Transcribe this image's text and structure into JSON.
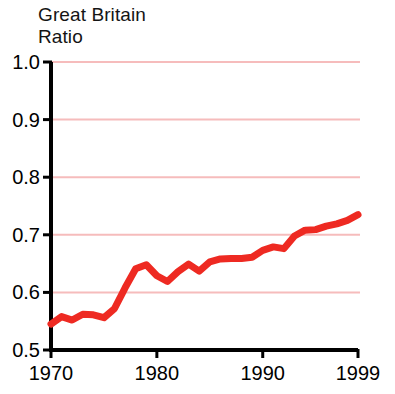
{
  "chart_title": "Great Britain\nRatio",
  "colors": {
    "line": "#ee2a22",
    "gridline": "#f6bcbc",
    "axis": "#000000",
    "background": "#ffffff",
    "text": "#141414"
  },
  "chart_data": {
    "type": "line",
    "title": "Great Britain Ratio",
    "subtitle": "",
    "xlabel": "",
    "ylabel": "",
    "xlim": [
      1970,
      1999
    ],
    "ylim": [
      0.5,
      1.0
    ],
    "grid": true,
    "legend": "none",
    "x_tick_labels": [
      "1970",
      "1980",
      "1990",
      "1999"
    ],
    "x_ticks": [
      1970,
      1980,
      1990,
      1999
    ],
    "y_tick_labels": [
      "0.5",
      "0.6",
      "0.7",
      "0.8",
      "0.9",
      "1.0"
    ],
    "y_ticks": [
      0.5,
      0.6,
      0.7,
      0.8,
      0.9,
      1.0
    ],
    "gridline_values": [
      0.6,
      0.7,
      0.8,
      0.9,
      1.0
    ],
    "series": [
      {
        "name": "Great Britain Ratio",
        "color": "#ee2a22",
        "x": [
          1970,
          1971,
          1972,
          1973,
          1974,
          1975,
          1976,
          1977,
          1978,
          1979,
          1980,
          1981,
          1982,
          1983,
          1984,
          1985,
          1986,
          1987,
          1988,
          1989,
          1990,
          1991,
          1992,
          1993,
          1994,
          1995,
          1996,
          1997,
          1998,
          1999
        ],
        "values": [
          0.545,
          0.558,
          0.552,
          0.562,
          0.561,
          0.556,
          0.572,
          0.608,
          0.641,
          0.648,
          0.629,
          0.619,
          0.636,
          0.649,
          0.637,
          0.653,
          0.658,
          0.659,
          0.659,
          0.661,
          0.673,
          0.679,
          0.676,
          0.698,
          0.708,
          0.709,
          0.715,
          0.719,
          0.725,
          0.735
        ]
      }
    ]
  }
}
